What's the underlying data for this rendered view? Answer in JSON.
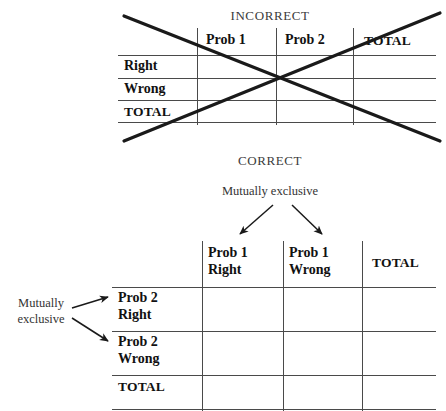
{
  "figure": {
    "incorrect": {
      "caption": "INCORRECT",
      "table": {
        "corner_label": "",
        "column_headers": [
          "Prob 1",
          "Prob 2",
          "TOTAL"
        ],
        "row_headers": [
          "Right",
          "Wrong",
          "TOTAL"
        ],
        "cells": [
          [
            "",
            "",
            ""
          ],
          [
            "",
            "",
            ""
          ],
          [
            "",
            "",
            ""
          ]
        ]
      },
      "annotation": "crossed-out"
    },
    "correct": {
      "caption": "CORRECT",
      "top_note": "Mutually exclusive",
      "left_note_line1": "Mutually",
      "left_note_line2": "exclusive",
      "table": {
        "corner_label": "",
        "column_headers": [
          {
            "line1": "Prob 1",
            "line2": "Right"
          },
          {
            "line1": "Prob 1",
            "line2": "Wrong"
          },
          {
            "line1": "TOTAL",
            "line2": ""
          }
        ],
        "row_headers": [
          {
            "line1": "Prob 2",
            "line2": "Right"
          },
          {
            "line1": "Prob 2",
            "line2": "Wrong"
          },
          {
            "line1": "TOTAL",
            "line2": ""
          }
        ],
        "cells": [
          [
            "",
            "",
            ""
          ],
          [
            "",
            "",
            ""
          ],
          [
            "",
            "",
            ""
          ]
        ]
      }
    }
  },
  "colors": {
    "rule": "#4a4a4a",
    "strike": "#1a1a1a",
    "text": "#111111",
    "caption": "#3b3b3b",
    "background": "#ffffff"
  }
}
